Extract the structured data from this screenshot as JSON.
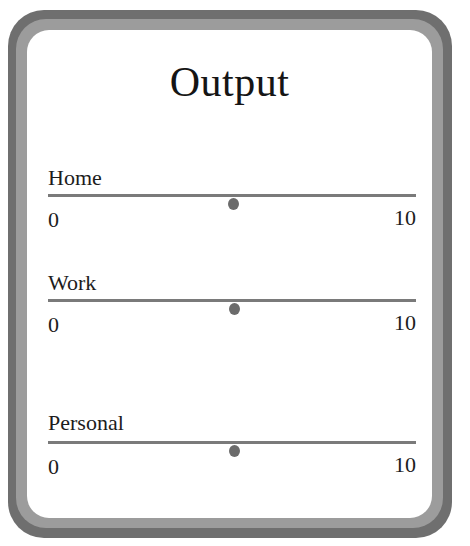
{
  "window": {
    "title": "Output"
  },
  "colors": {
    "frame_outer": "#6f6f6f",
    "frame_inner": "#9c9c9c",
    "panel": "#ffffff",
    "track": "#7a7a7a",
    "thumb": "#6b6b6b"
  },
  "sliders": [
    {
      "label": "Home",
      "min": "0",
      "max": "10",
      "value": 5
    },
    {
      "label": "Work",
      "min": "0",
      "max": "10",
      "value": 5
    },
    {
      "label": "Personal",
      "min": "0",
      "max": "10",
      "value": 5
    }
  ]
}
